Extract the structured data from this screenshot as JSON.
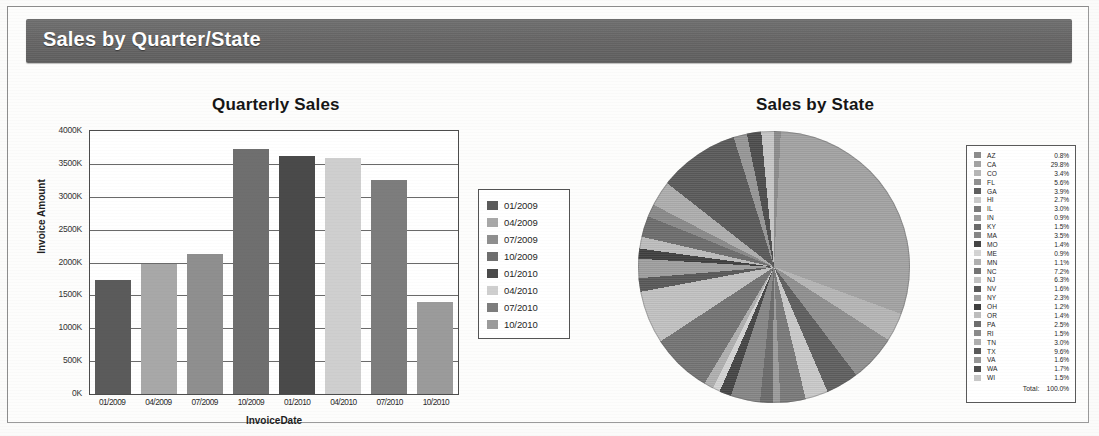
{
  "header": {
    "title": "Sales by Quarter/State"
  },
  "bar_section": {
    "title": "Quarterly Sales"
  },
  "pie_section": {
    "title": "Sales by State"
  },
  "pie_legend": {
    "total_label": "Total:",
    "total_value": "100.0%"
  },
  "chart_data": [
    {
      "type": "bar",
      "title": "Quarterly Sales",
      "xlabel": "InvoiceDate",
      "ylabel": "Invoice Amount",
      "ylim": [
        0,
        4000
      ],
      "yticks": [
        "0K",
        "500K",
        "1000K",
        "1500K",
        "2000K",
        "2500K",
        "3000K",
        "3500K",
        "4000K"
      ],
      "grid": true,
      "legend_position": "right",
      "categories": [
        "01/2009",
        "04/2009",
        "07/2009",
        "10/2009",
        "01/2010",
        "04/2010",
        "07/2010",
        "10/2010"
      ],
      "values": [
        1740,
        1980,
        2130,
        3720,
        3620,
        3590,
        3250,
        1400
      ],
      "colors": [
        "#5b5b5b",
        "#a8a8a8",
        "#8f8f8f",
        "#6f6f6f",
        "#4a4a4a",
        "#cfcfcf",
        "#7d7d7d",
        "#9b9b9b"
      ],
      "legend": [
        "01/2009",
        "04/2009",
        "07/2009",
        "10/2009",
        "01/2010",
        "04/2010",
        "07/2010",
        "10/2010"
      ]
    },
    {
      "type": "pie",
      "title": "Sales by State",
      "legend_position": "right",
      "categories": [
        "AZ",
        "CA",
        "CO",
        "FL",
        "GA",
        "HI",
        "IL",
        "IN",
        "KY",
        "MA",
        "MO",
        "ME",
        "MN",
        "NC",
        "NJ",
        "NV",
        "NY",
        "OH",
        "OR",
        "PA",
        "RI",
        "TN",
        "TX",
        "VA",
        "WA",
        "WI"
      ],
      "values": [
        0.8,
        29.8,
        3.4,
        5.6,
        3.9,
        2.7,
        3.0,
        0.9,
        1.5,
        3.5,
        1.4,
        0.9,
        1.1,
        7.2,
        6.3,
        1.6,
        2.3,
        1.2,
        1.4,
        2.5,
        1.5,
        3.0,
        9.6,
        1.6,
        1.7,
        1.5
      ],
      "labels": [
        "0.8%",
        "29.8%",
        "3.4%",
        "5.6%",
        "3.9%",
        "2.7%",
        "3.0%",
        "0.9%",
        "1.5%",
        "3.5%",
        "1.4%",
        "0.9%",
        "1.1%",
        "7.2%",
        "6.3%",
        "1.6%",
        "2.3%",
        "1.2%",
        "1.4%",
        "2.5%",
        "1.5%",
        "3.0%",
        "9.6%",
        "1.6%",
        "1.7%",
        "1.5%"
      ],
      "colors": [
        "#8c8c8c",
        "#a3a3a3",
        "#b6b6b6",
        "#909090",
        "#5f5f5f",
        "#cacaca",
        "#7a7a7a",
        "#9c9c9c",
        "#6b6b6b",
        "#868686",
        "#454545",
        "#d4d4d4",
        "#b0b0b0",
        "#747474",
        "#c2c2c2",
        "#585858",
        "#9f9f9f",
        "#3f3f3f",
        "#bdbdbd",
        "#6d6d6d",
        "#8a8a8a",
        "#aeaeae",
        "#5a5a5a",
        "#979797",
        "#4d4d4d",
        "#c7c7c7"
      ],
      "total_label": "Total:",
      "total_value": "100.0%"
    }
  ]
}
